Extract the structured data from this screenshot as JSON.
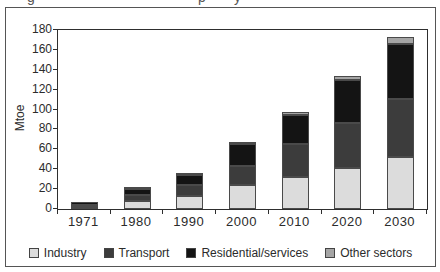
{
  "caption_fragments": [
    "g",
    "p",
    "y"
  ],
  "chart_data": {
    "type": "bar",
    "stacked": true,
    "title": "",
    "categories": [
      "1971",
      "1980",
      "1990",
      "2000",
      "2010",
      "2020",
      "2030"
    ],
    "series": [
      {
        "name": "Industry",
        "color": "#dcdcdc",
        "values": [
          2,
          8,
          13,
          24,
          32,
          41,
          52
        ]
      },
      {
        "name": "Transport",
        "color": "#3c3c3c",
        "values": [
          2,
          6,
          11,
          19,
          33,
          45,
          58
        ]
      },
      {
        "name": "Residential/services",
        "color": "#141414",
        "values": [
          3,
          6,
          10,
          22,
          29,
          43,
          55
        ]
      },
      {
        "name": "Other sectors",
        "color": "#a5a5a5",
        "values": [
          0,
          1,
          1,
          2,
          3,
          4,
          7
        ]
      }
    ],
    "totals": [
      7,
      21,
      35,
      67,
      97,
      133,
      172
    ],
    "xlabel": "",
    "ylabel": "Mtoe",
    "ylim": [
      0,
      180
    ],
    "ytick_step": 20,
    "grid": false,
    "legend_position": "bottom"
  }
}
